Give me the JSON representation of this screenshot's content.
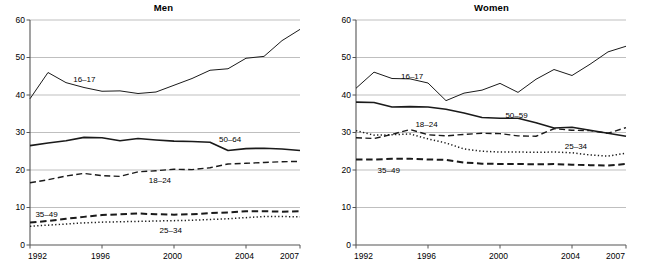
{
  "figure": {
    "panels": [
      {
        "key": "men",
        "title": "Men"
      },
      {
        "key": "women",
        "title": "Women"
      }
    ]
  },
  "chart_data": [
    {
      "type": "line",
      "title": "Men",
      "xlabel": "",
      "ylabel": "",
      "xlim": [
        1992,
        2007
      ],
      "ylim": [
        0,
        60
      ],
      "grid": true,
      "legend_position": "inline-labels",
      "yticks": [
        0,
        10,
        20,
        30,
        40,
        50,
        60
      ],
      "ytick_labels": [
        "0",
        "10",
        "20",
        "30",
        "40",
        "50",
        "60"
      ],
      "xticks": [
        1992,
        1996,
        2000,
        2004,
        2007
      ],
      "xtick_labels": [
        "1992",
        "1996",
        "2000",
        "2004",
        "2007"
      ],
      "x": [
        1992,
        1993,
        1994,
        1995,
        1996,
        1997,
        1998,
        1999,
        2000,
        2001,
        2002,
        2003,
        2004,
        2005,
        2006,
        2007
      ],
      "series": [
        {
          "name": "16–17",
          "style": "solid-thin",
          "values": [
            39.0,
            46.0,
            43.3,
            42.0,
            41.0,
            41.1,
            40.4,
            40.8,
            42.6,
            44.4,
            46.6,
            47.0,
            49.8,
            50.3,
            54.5,
            57.5
          ]
        },
        {
          "name": "50–64",
          "style": "solid-thick",
          "values": [
            26.5,
            27.2,
            27.8,
            28.7,
            28.6,
            27.8,
            28.4,
            28.0,
            27.7,
            27.6,
            27.4,
            25.2,
            25.7,
            25.8,
            25.6,
            25.2
          ]
        },
        {
          "name": "18–24",
          "style": "dashed",
          "values": [
            16.6,
            17.4,
            18.4,
            19.1,
            18.5,
            18.3,
            19.5,
            19.8,
            20.2,
            20.1,
            20.6,
            21.6,
            21.8,
            22.0,
            22.2,
            22.3
          ]
        },
        {
          "name": "35–49",
          "style": "dashed-bold",
          "values": [
            6.0,
            6.4,
            7.0,
            7.5,
            8.0,
            8.2,
            8.4,
            8.2,
            8.1,
            8.2,
            8.5,
            8.7,
            9.0,
            9.0,
            8.9,
            9.0
          ]
        },
        {
          "name": "25–34",
          "style": "dotted",
          "values": [
            5.0,
            5.3,
            5.6,
            5.9,
            6.1,
            6.2,
            6.3,
            6.4,
            6.5,
            6.6,
            6.8,
            7.0,
            7.3,
            7.6,
            7.6,
            7.5
          ]
        }
      ]
    },
    {
      "type": "line",
      "title": "Women",
      "xlabel": "",
      "ylabel": "",
      "xlim": [
        1992,
        2007
      ],
      "ylim": [
        0,
        60
      ],
      "grid": true,
      "legend_position": "inline-labels",
      "yticks": [
        0,
        10,
        20,
        30,
        40,
        50,
        60
      ],
      "ytick_labels": [
        "0",
        "10",
        "20",
        "30",
        "40",
        "50",
        "60"
      ],
      "xticks": [
        1992,
        1996,
        2000,
        2004,
        2007
      ],
      "xtick_labels": [
        "1992",
        "1996",
        "2000",
        "2004",
        "2007"
      ],
      "x": [
        1992,
        1993,
        1994,
        1995,
        1996,
        1997,
        1998,
        1999,
        2000,
        2001,
        2002,
        2003,
        2004,
        2005,
        2006,
        2007
      ],
      "series": [
        {
          "name": "16–17",
          "style": "solid-thin",
          "values": [
            41.8,
            46.1,
            44.4,
            44.3,
            43.2,
            38.5,
            40.5,
            41.3,
            43.1,
            40.7,
            44.2,
            46.8,
            45.2,
            48.2,
            51.5,
            53.0
          ]
        },
        {
          "name": "50–59",
          "style": "solid-thick",
          "values": [
            38.1,
            38.0,
            36.8,
            36.9,
            36.8,
            36.2,
            35.2,
            34.0,
            33.8,
            33.8,
            32.6,
            31.2,
            31.4,
            30.6,
            29.8,
            29.0
          ]
        },
        {
          "name": "18–24",
          "style": "dashed",
          "values": [
            28.6,
            28.4,
            29.5,
            30.8,
            29.4,
            29.1,
            29.5,
            29.8,
            29.7,
            29.1,
            29.0,
            31.0,
            30.6,
            30.5,
            29.8,
            31.3
          ]
        },
        {
          "name": "25–34",
          "style": "dotted",
          "values": [
            30.5,
            29.3,
            29.4,
            29.6,
            28.3,
            27.2,
            25.6,
            25.0,
            24.8,
            24.8,
            24.7,
            24.8,
            24.6,
            24.0,
            23.7,
            24.5
          ]
        },
        {
          "name": "35–49",
          "style": "dashed-bold",
          "values": [
            22.8,
            22.8,
            23.0,
            23.0,
            22.8,
            22.7,
            22.0,
            21.7,
            21.6,
            21.6,
            21.5,
            21.6,
            21.4,
            21.3,
            21.2,
            21.6
          ]
        }
      ]
    }
  ],
  "annotations": {
    "men": [
      {
        "text": "16–17",
        "x": 1994.4,
        "y": 43.9
      },
      {
        "text": "50–64",
        "x": 2002.5,
        "y": 27.8
      },
      {
        "text": "18–24",
        "x": 1998.6,
        "y": 16.9
      },
      {
        "text": "35–49",
        "x": 1992.3,
        "y": 8.0
      },
      {
        "text": "25–34",
        "x": 1999.2,
        "y": 3.7
      }
    ],
    "women": [
      {
        "text": "16–17",
        "x": 1994.5,
        "y": 44.8
      },
      {
        "text": "50–59",
        "x": 2000.3,
        "y": 34.4
      },
      {
        "text": "18–24",
        "x": 1995.3,
        "y": 32.0
      },
      {
        "text": "25–34",
        "x": 2003.6,
        "y": 26.0
      },
      {
        "text": "35–49",
        "x": 1993.2,
        "y": 19.6
      }
    ]
  },
  "colors": {
    "line": "#1a1a1a",
    "grid": "#b8b8b8",
    "axis": "#555555",
    "text": "#000000"
  }
}
